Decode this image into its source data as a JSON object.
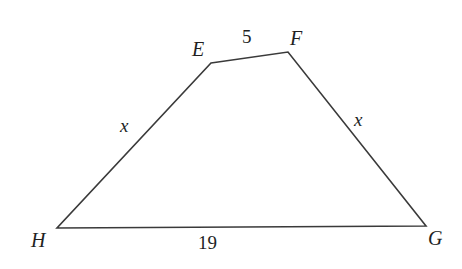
{
  "figure": {
    "kind": "trapezoid-diagram",
    "name": "Trapezoid EFGH",
    "background_color": "#ffffff",
    "stroke_color": "#3a3a3a",
    "text_color": "#221f1f",
    "stroke_width": 1.6,
    "vertices": [
      {
        "id": "E",
        "label": "E",
        "x": 211,
        "y": 63
      },
      {
        "id": "F",
        "label": "F",
        "x": 288,
        "y": 52
      },
      {
        "id": "G",
        "label": "G",
        "x": 426,
        "y": 226
      },
      {
        "id": "H",
        "label": "H",
        "x": 57,
        "y": 228
      }
    ],
    "edges": [
      {
        "id": "EF",
        "from": "E",
        "to": "F",
        "label": "5"
      },
      {
        "id": "FG",
        "from": "F",
        "to": "G",
        "label": "x"
      },
      {
        "id": "GH",
        "from": "G",
        "to": "H",
        "label": "19"
      },
      {
        "id": "HE",
        "from": "H",
        "to": "E",
        "label": "x"
      }
    ],
    "side_labels": {
      "top": "5",
      "left_leg": "x",
      "right_leg": "x",
      "bottom": "19"
    },
    "vertex_labels": {
      "E": "E",
      "F": "F",
      "G": "G",
      "H": "H"
    }
  }
}
